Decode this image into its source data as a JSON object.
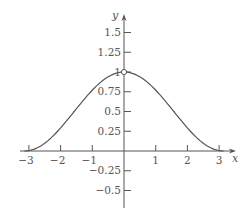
{
  "chart_data": {
    "type": "line",
    "title": "",
    "xlabel": "x",
    "ylabel": "y",
    "xlim": [
      -3.2,
      3.5
    ],
    "ylim": [
      -0.72,
      1.72
    ],
    "grid": false,
    "legend": null,
    "x_ticks": [
      -3,
      -2,
      -1,
      1,
      2,
      3
    ],
    "x_tick_labels": [
      "−3",
      "−2",
      "−1",
      "1",
      "2",
      "3"
    ],
    "y_ticks": [
      1.5,
      1.25,
      1,
      0.75,
      0.5,
      0.25,
      -0.25,
      -0.5
    ],
    "y_tick_labels": [
      "1.5",
      "1.25",
      "1",
      "0.75",
      "0.5",
      "0.25",
      "−0.25",
      "−0.5"
    ],
    "series": [
      {
        "name": "y = (1 + cos x) / 2",
        "x": [
          -3.14,
          -3,
          -2.5,
          -2,
          -1.5,
          -1,
          -0.5,
          0,
          0.5,
          1,
          1.5,
          2,
          2.5,
          3,
          3.14
        ],
        "y": [
          0,
          0.005,
          0.1,
          0.29,
          0.54,
          0.77,
          0.94,
          1,
          0.94,
          0.77,
          0.54,
          0.29,
          0.1,
          0.005,
          0
        ]
      }
    ],
    "annotations": [
      {
        "type": "open-circle",
        "x": 0,
        "y": 1
      }
    ]
  },
  "colors": {
    "axis": "#555555",
    "curve": "#555555"
  }
}
